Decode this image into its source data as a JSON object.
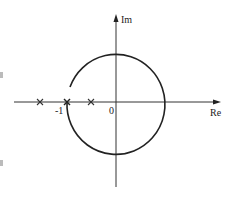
{
  "diagram": {
    "type": "nyquist-plot",
    "axes": {
      "real_label": "Re",
      "imag_label": "Im",
      "origin_label": "0"
    },
    "markers": {
      "critical_point_label": "-1",
      "poles_on_real_axis": 3
    },
    "curve": {
      "description": "circular Nyquist contour centered on origin, arc from upper-left clockwise around through right side back to the -1 point",
      "stroke_color": "#222222"
    },
    "colors": {
      "background": "#ffffff",
      "ink": "#222222"
    }
  }
}
